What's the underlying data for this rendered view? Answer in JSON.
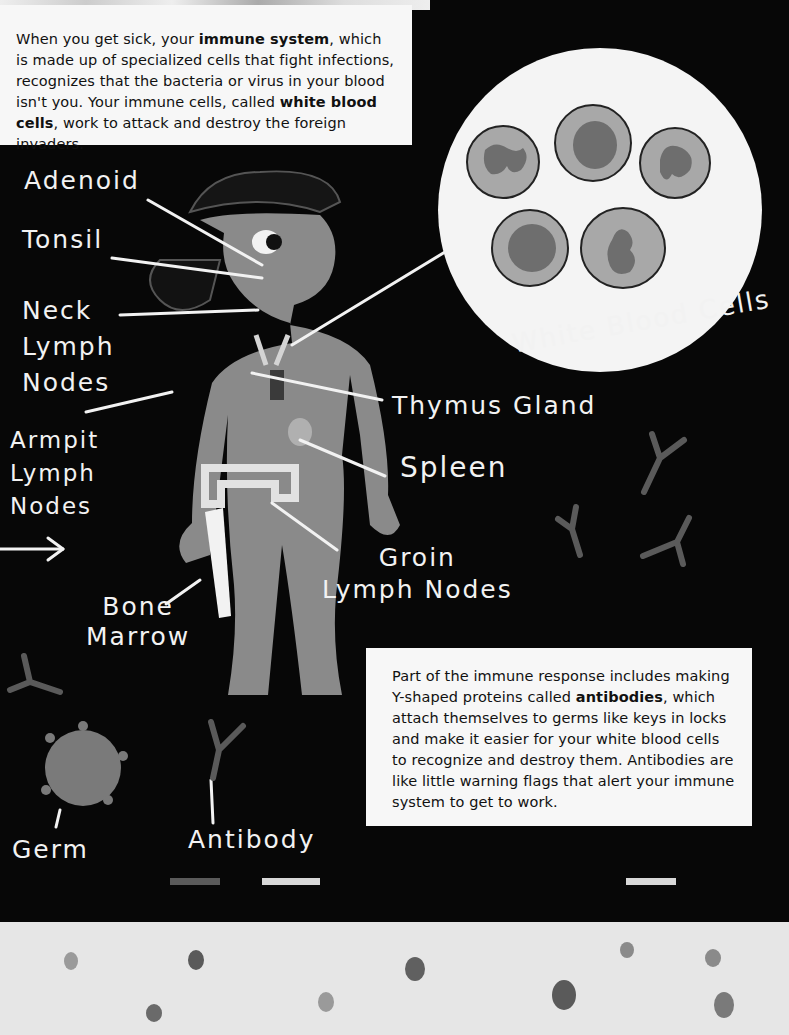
{
  "intro": {
    "parts": [
      {
        "text": "When you get sick, your ",
        "bold": false
      },
      {
        "text": "immune system",
        "bold": true
      },
      {
        "text": ", which is made up of specialized cells that fight infections, recognizes that the bacteria or virus in your blood isn't you. Your immune cells, called ",
        "bold": false
      },
      {
        "text": "white blood cells",
        "bold": true
      },
      {
        "text": ", work to attack and destroy the foreign invaders.",
        "bold": false
      }
    ]
  },
  "antibody_box": {
    "parts": [
      {
        "text": "Part of the immune response includes making Y-shaped proteins called ",
        "bold": false
      },
      {
        "text": "antibodies",
        "bold": true
      },
      {
        "text": ", which attach themselves to germs like keys in locks and make it easier for your white blood cells to recognize and destroy them. Antibodies are like little warning flags that alert your immune system to get to work.",
        "bold": false
      }
    ]
  },
  "labels": {
    "adenoid": "Adenoid",
    "tonsil": "Tonsil",
    "neck_lymph_nodes": "Neck\nLymph\nNodes",
    "armpit_lymph_nodes": "Armpit\nLymph\nNodes",
    "bone_marrow": "Bone\nMarrow",
    "thymus_gland": "Thymus Gland",
    "spleen": "Spleen",
    "groin_lymph_nodes": "Groin\nLymph Nodes",
    "white_blood_cells": "White Blood Cells",
    "germ": "Germ",
    "antibody": "Antibody"
  },
  "colors": {
    "board": "#070707",
    "chalk": "#f2f2f2",
    "body": "#8a8a8a",
    "cell": "#a8a8a8",
    "nucleus": "#6e6e6e",
    "paper": "#f7f7f7",
    "bottom": "#e6e6e6"
  }
}
